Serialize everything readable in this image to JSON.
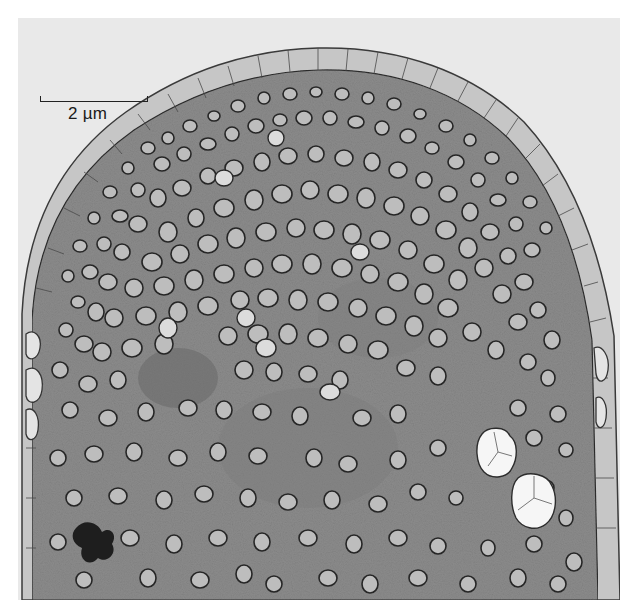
{
  "figure": {
    "type": "transmission electron micrograph",
    "scale_bar": {
      "label": "2 µm",
      "length_px": 108
    },
    "colors": {
      "page_background": "#ffffff",
      "image_background": "#e9e9e9",
      "cytoplasm": "#8a8a8a",
      "wall_layer": "#c4c4c4",
      "vesicle_outline": "#2a2a2a",
      "vesicle_fill": "#bdbdbd",
      "large_vacuoles": "#f4f4f4",
      "dark_inclusion": "#1e1e1e"
    }
  }
}
